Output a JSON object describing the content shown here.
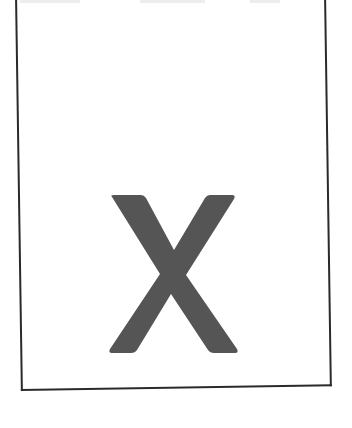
{
  "document": {
    "letter": "X",
    "colors": {
      "background": "#ffffff",
      "frame": "#2a2a2a",
      "glyph": "#555555"
    }
  }
}
